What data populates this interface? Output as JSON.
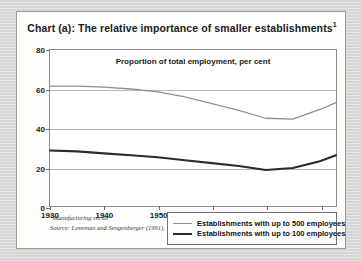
{
  "figure": {
    "title_main": "Chart (a): The relative importance of smaller establishments",
    "title_footnote_marker": "1",
    "subtitle": "Proportion of total employment, per cent",
    "footnote_marker": "1",
    "footnote_line1": "Manufacturing sector",
    "footnote_line2": "Source: Loveman and Sengenberger (1991)."
  },
  "colors": {
    "series_500": "#8f8f8f",
    "series_100": "#2b2b2b",
    "grid": "#b9b9b5",
    "axis": "#8e8e8a",
    "panel_bg": "#fdfdfc",
    "page_bg": "#d8d9d6"
  },
  "legend": {
    "items": [
      {
        "label": "Establishments with up to 500 employees",
        "color": "#8f8f8f",
        "width": 1.4
      },
      {
        "label": "Establishments with up to 100 employees",
        "color": "#2b2b2b",
        "width": 2.2
      }
    ]
  },
  "chart_data": {
    "type": "line",
    "title": "Chart (a): The relative importance of smaller establishments",
    "subtitle": "Proportion of total employment, per cent",
    "xlabel": "",
    "ylabel": "Proportion of total employment, per cent",
    "xlim": [
      1930,
      1983
    ],
    "ylim": [
      0,
      80
    ],
    "yticks": [
      0,
      20,
      40,
      60,
      80
    ],
    "xticks": [
      1930,
      1940,
      1950,
      1960,
      1970,
      1980
    ],
    "grid": true,
    "legend_position": "bottom-right",
    "series": [
      {
        "name": "Establishments with up to 500 employees",
        "color": "#8f8f8f",
        "x": [
          1930,
          1935,
          1940,
          1945,
          1950,
          1955,
          1960,
          1965,
          1970,
          1975,
          1980,
          1983
        ],
        "values": [
          61.5,
          61.5,
          61.0,
          60.0,
          58.5,
          56.0,
          52.5,
          49.0,
          45.0,
          44.5,
          49.5,
          53.0
        ]
      },
      {
        "name": "Establishments with up to 100 employees",
        "color": "#2b2b2b",
        "x": [
          1930,
          1935,
          1940,
          1945,
          1950,
          1955,
          1960,
          1965,
          1970,
          1975,
          1980,
          1983
        ],
        "values": [
          28.5,
          28.0,
          27.0,
          26.0,
          25.0,
          23.5,
          22.0,
          20.5,
          18.5,
          19.5,
          23.0,
          26.0
        ]
      }
    ]
  }
}
